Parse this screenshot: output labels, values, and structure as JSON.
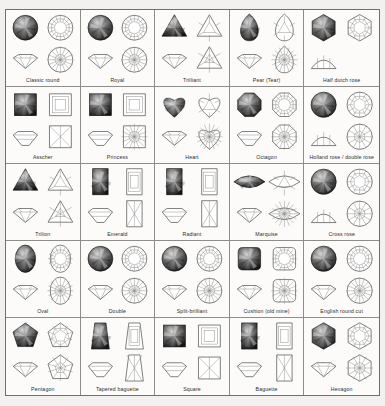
{
  "document": {
    "title": "Gemstone Cuts Reference Chart",
    "background_color": "#f2f1ef",
    "paper_color": "#fbfaf8",
    "border_color": "#6f6f6f",
    "line_color": "#6b6b68",
    "label_color": "#2d2d2d",
    "grid": {
      "columns": 5,
      "rows": 5
    }
  },
  "panel_roles": {
    "photo": "gem-photograph",
    "crown": "crown-view-diagram",
    "profile": "side-profile-diagram",
    "pavilion": "pavilion-view-diagram"
  },
  "cuts": [
    {
      "label": "Classic round",
      "row": 1,
      "column": 1,
      "shape": "round",
      "panels": [
        "photo",
        "crown",
        "profile",
        "pavilion"
      ]
    },
    {
      "label": "Royal",
      "row": 1,
      "column": 2,
      "shape": "round",
      "panels": [
        "photo",
        "crown",
        "profile",
        "pavilion"
      ]
    },
    {
      "label": "Trilliant",
      "row": 1,
      "column": 3,
      "shape": "triangle",
      "panels": [
        "photo",
        "crown",
        "profile",
        "pavilion"
      ]
    },
    {
      "label": "Pear (Tear)",
      "row": 1,
      "column": 4,
      "shape": "pear",
      "panels": [
        "photo",
        "crown",
        "profile",
        "pavilion"
      ]
    },
    {
      "label": "Half dutch rose",
      "row": 1,
      "column": 5,
      "shape": "hexagon-rose",
      "panels": [
        "photo",
        "crown",
        "profile"
      ]
    },
    {
      "label": "Asscher",
      "row": 2,
      "column": 1,
      "shape": "square-step",
      "panels": [
        "photo",
        "crown",
        "profile",
        "pavilion"
      ]
    },
    {
      "label": "Princess",
      "row": 2,
      "column": 2,
      "shape": "square",
      "panels": [
        "photo",
        "crown",
        "profile",
        "pavilion"
      ]
    },
    {
      "label": "Heart",
      "row": 2,
      "column": 3,
      "shape": "heart",
      "panels": [
        "photo",
        "crown",
        "profile",
        "pavilion"
      ]
    },
    {
      "label": "Octagon",
      "row": 2,
      "column": 4,
      "shape": "octagon",
      "panels": [
        "photo",
        "crown",
        "profile",
        "pavilion"
      ]
    },
    {
      "label": "Holland rose / double rose",
      "row": 2,
      "column": 5,
      "shape": "rose",
      "panels": [
        "photo",
        "crown",
        "profile",
        "pavilion"
      ]
    },
    {
      "label": "Trilion",
      "row": 3,
      "column": 1,
      "shape": "triangle-round",
      "panels": [
        "photo",
        "crown",
        "profile",
        "pavilion"
      ]
    },
    {
      "label": "Emerald",
      "row": 3,
      "column": 2,
      "shape": "rectangle-step",
      "panels": [
        "photo",
        "crown",
        "profile",
        "pavilion"
      ]
    },
    {
      "label": "Radiant",
      "row": 3,
      "column": 3,
      "shape": "rectangle-cut-corner",
      "panels": [
        "photo",
        "crown",
        "profile",
        "pavilion"
      ]
    },
    {
      "label": "Marquise",
      "row": 3,
      "column": 4,
      "shape": "marquise",
      "panels": [
        "photo",
        "crown",
        "profile",
        "pavilion"
      ]
    },
    {
      "label": "Cross rose",
      "row": 3,
      "column": 5,
      "shape": "rose-cross",
      "panels": [
        "photo",
        "crown",
        "profile",
        "pavilion"
      ]
    },
    {
      "label": "Oval",
      "row": 4,
      "column": 1,
      "shape": "oval",
      "panels": [
        "photo",
        "crown",
        "profile",
        "pavilion"
      ]
    },
    {
      "label": "Double",
      "row": 4,
      "column": 2,
      "shape": "round-double",
      "panels": [
        "photo",
        "crown",
        "profile",
        "pavilion"
      ]
    },
    {
      "label": "Split-brilliant",
      "row": 4,
      "column": 3,
      "shape": "round-split",
      "panels": [
        "photo",
        "crown",
        "profile",
        "pavilion"
      ]
    },
    {
      "label": "Cushion (old mine)",
      "row": 4,
      "column": 4,
      "shape": "cushion",
      "panels": [
        "photo",
        "crown",
        "profile",
        "pavilion"
      ]
    },
    {
      "label": "English round cut",
      "row": 4,
      "column": 5,
      "shape": "round-english",
      "panels": [
        "photo",
        "crown",
        "profile",
        "pavilion"
      ]
    },
    {
      "label": "Pentagon",
      "row": 5,
      "column": 1,
      "shape": "pentagon",
      "panels": [
        "photo",
        "crown",
        "profile",
        "pavilion"
      ]
    },
    {
      "label": "Tapered baguette",
      "row": 5,
      "column": 2,
      "shape": "tapered-baguette",
      "panels": [
        "photo",
        "crown",
        "profile",
        "pavilion"
      ]
    },
    {
      "label": "Square",
      "row": 5,
      "column": 3,
      "shape": "square-step",
      "panels": [
        "photo",
        "crown",
        "profile",
        "pavilion"
      ]
    },
    {
      "label": "Baguette",
      "row": 5,
      "column": 4,
      "shape": "baguette",
      "panels": [
        "photo",
        "crown",
        "profile",
        "pavilion"
      ]
    },
    {
      "label": "Hexagon",
      "row": 5,
      "column": 5,
      "shape": "hexagon",
      "panels": [
        "photo",
        "crown",
        "profile",
        "pavilion"
      ]
    }
  ]
}
